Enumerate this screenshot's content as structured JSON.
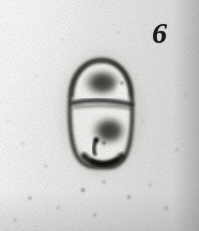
{
  "figure": {
    "number_label": "6",
    "caption_visible": "",
    "medium": "electron micrograph",
    "tone": "black-and-white grainy photographic print"
  },
  "colors": {
    "paper_light": "#ffffff",
    "paper_mid": "#ebebea",
    "paper_dark": "#dcdcdb",
    "grain": "#8d8d8a",
    "wall_dark": "#171716",
    "wall_mid": "#3b3b38",
    "nucleoid_dark": "#44443f",
    "nucleoid_core": "#2e2e2a",
    "cytoplasm_light": "#f6f6f4",
    "label_ink": "#1a1a19"
  },
  "specimen": {
    "name": "dividing cell",
    "description": "ovoid cell enclosed by a dark cell wall, partitioned by a transverse septum into an upper and a lower compartment, each containing a dark condensed nucleoid mass",
    "bounds_px": {
      "x": 70,
      "y": 58,
      "width": 63,
      "height": 110
    },
    "structures": [
      {
        "id": "cell-wall",
        "label": "cell wall / outer envelope",
        "tone": "dark",
        "shape": "closed ovoid outline",
        "bounds_px": {
          "x": 70,
          "y": 58,
          "width": 63,
          "height": 110
        }
      },
      {
        "id": "septum",
        "label": "transverse septum",
        "tone": "dark",
        "shape": "horizontal dividing band",
        "bounds_px": {
          "x": 71,
          "y": 100,
          "width": 61,
          "height": 9
        }
      },
      {
        "id": "upper-compartment",
        "label": "upper compartment",
        "tone": "light cytoplasm",
        "bounds_px": {
          "x": 74,
          "y": 62,
          "width": 55,
          "height": 40
        }
      },
      {
        "id": "upper-nucleoid",
        "label": "upper nucleoid mass",
        "tone": "dark",
        "bounds_px": {
          "x": 86,
          "y": 70,
          "width": 33,
          "height": 26
        }
      },
      {
        "id": "lower-compartment",
        "label": "lower compartment",
        "tone": "light cytoplasm",
        "bounds_px": {
          "x": 73,
          "y": 107,
          "width": 57,
          "height": 56
        }
      },
      {
        "id": "lower-nucleoid",
        "label": "lower nucleoid mass",
        "tone": "dark",
        "bounds_px": {
          "x": 93,
          "y": 117,
          "width": 32,
          "height": 28
        }
      },
      {
        "id": "dark-inclusion",
        "label": "dark inclusion / invagination at lower wall",
        "tone": "very dark",
        "bounds_px": {
          "x": 92,
          "y": 140,
          "width": 10,
          "height": 14
        }
      },
      {
        "id": "basal-wall-thickening",
        "label": "thickened dark basal wall",
        "tone": "near black",
        "bounds_px": {
          "x": 90,
          "y": 154,
          "width": 34,
          "height": 12
        }
      }
    ],
    "background_specks": [
      {
        "x": 30,
        "y": 198,
        "r": 1.6
      },
      {
        "x": 58,
        "y": 208,
        "r": 1.3
      },
      {
        "x": 83,
        "y": 190,
        "r": 2.0
      },
      {
        "x": 104,
        "y": 182,
        "r": 1.4
      },
      {
        "x": 129,
        "y": 197,
        "r": 1.7
      },
      {
        "x": 150,
        "y": 185,
        "r": 1.2
      },
      {
        "x": 166,
        "y": 208,
        "r": 1.5
      },
      {
        "x": 46,
        "y": 166,
        "r": 1.2
      },
      {
        "x": 23,
        "y": 143,
        "r": 1.1
      },
      {
        "x": 15,
        "y": 220,
        "r": 1.3
      },
      {
        "x": 177,
        "y": 150,
        "r": 1.2
      },
      {
        "x": 143,
        "y": 121,
        "r": 1.1
      },
      {
        "x": 62,
        "y": 40,
        "r": 1.0
      },
      {
        "x": 36,
        "y": 76,
        "r": 1.0
      },
      {
        "x": 118,
        "y": 33,
        "r": 1.1
      },
      {
        "x": 95,
        "y": 215,
        "r": 1.4
      },
      {
        "x": 186,
        "y": 96,
        "r": 1.0
      },
      {
        "x": 8,
        "y": 121,
        "r": 1.0
      }
    ]
  }
}
